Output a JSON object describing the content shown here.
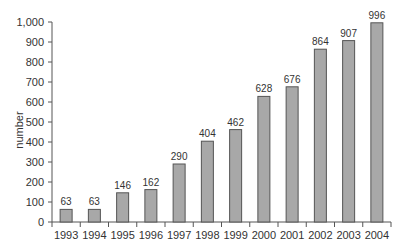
{
  "chart_data": {
    "type": "bar",
    "title": "",
    "xlabel": "",
    "ylabel": "number",
    "categories": [
      "1993",
      "1994",
      "1995",
      "1996",
      "1997",
      "1998",
      "1999",
      "2000",
      "2001",
      "2002",
      "2003",
      "2004"
    ],
    "values": [
      63,
      63,
      146,
      162,
      290,
      404,
      462,
      628,
      676,
      864,
      907,
      996
    ],
    "ylim": [
      0,
      1000
    ],
    "yticks": [
      0,
      100,
      200,
      300,
      400,
      500,
      600,
      700,
      800,
      900,
      1000
    ],
    "ytick_labels": [
      "0",
      "100",
      "200",
      "300",
      "400",
      "500",
      "600",
      "700",
      "800",
      "900",
      "1,000"
    ],
    "grid": false,
    "legend": null,
    "bar_color": "#a8a8a8",
    "bar_edge_color": "#555555"
  }
}
